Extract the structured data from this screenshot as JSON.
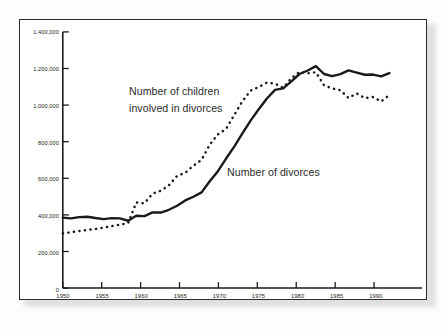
{
  "chart_data": {
    "type": "line",
    "title": "",
    "xlabel": "",
    "ylabel": "",
    "xlim": [
      1950,
      1994
    ],
    "ylim": [
      0,
      1400000
    ],
    "grid": false,
    "legend_position": "inline-annotations",
    "x_ticks": [
      1950,
      1955,
      1960,
      1965,
      1970,
      1975,
      1980,
      1985,
      1990
    ],
    "x_tick_labels": [
      "1950",
      "1955",
      "1960",
      "1965",
      "1970",
      "1975",
      "1980",
      "1985",
      "1990"
    ],
    "y_ticks": [
      0,
      200000,
      400000,
      600000,
      800000,
      1000000,
      1200000,
      1400000
    ],
    "y_tick_labels": [
      "0",
      "200,000",
      "400,000",
      "600,000",
      "800,000",
      "1,000,000",
      "1,200,000",
      "1,400,000"
    ],
    "annotations": [
      {
        "text_line1": "Number of children",
        "text_line2": "involved in divorces",
        "series": "children"
      },
      {
        "text_line1": "Number of divorces",
        "text_line2": "",
        "series": "divorces"
      }
    ],
    "x": [
      1950,
      1951,
      1952,
      1953,
      1954,
      1955,
      1956,
      1957,
      1958,
      1959,
      1960,
      1961,
      1962,
      1963,
      1964,
      1965,
      1966,
      1967,
      1968,
      1969,
      1970,
      1971,
      1972,
      1973,
      1974,
      1975,
      1976,
      1977,
      1978,
      1979,
      1980,
      1981,
      1982,
      1983,
      1984,
      1985,
      1986,
      1987,
      1988,
      1989,
      1990
    ],
    "series": [
      {
        "name": "Number of divorces",
        "style": "solid",
        "color": "#1a1a1a",
        "values": [
          385000,
          381000,
          388000,
          390000,
          383000,
          377000,
          382000,
          381000,
          368000,
          395000,
          393000,
          414000,
          413000,
          428000,
          450000,
          479000,
          499000,
          523000,
          584000,
          639000,
          708000,
          773000,
          845000,
          915000,
          977000,
          1036000,
          1083000,
          1091000,
          1130000,
          1170000,
          1189000,
          1213000,
          1170000,
          1158000,
          1169000,
          1190000,
          1178000,
          1166000,
          1167000,
          1157000,
          1175000
        ]
      },
      {
        "name": "Number of children involved in divorces",
        "style": "dotted",
        "color": "#1a1a1a",
        "values": [
          299000,
          305000,
          312000,
          318000,
          323000,
          330000,
          339000,
          347000,
          355000,
          468000,
          463000,
          516000,
          532000,
          562000,
          613000,
          630000,
          669000,
          701000,
          784000,
          840000,
          870000,
          946000,
          1021000,
          1079000,
          1099000,
          1123000,
          1117000,
          1095000,
          1147000,
          1181000,
          1174000,
          1180000,
          1108000,
          1091000,
          1081000,
          1039000,
          1064000,
          1038000,
          1044000,
          1020000,
          1055000
        ]
      }
    ]
  },
  "axis": {
    "y_label_0": "0",
    "y_label_1": "200,000",
    "y_label_2": "400,000",
    "y_label_3": "600,000",
    "y_label_4": "800,000",
    "y_label_5": "1,000,000",
    "y_label_6": "1,200,000",
    "y_label_7": "1,400,000",
    "x_label_0": "1950",
    "x_label_1": "1955",
    "x_label_2": "1960",
    "x_label_3": "1965",
    "x_label_4": "1970",
    "x_label_5": "1975",
    "x_label_6": "1980",
    "x_label_7": "1985",
    "x_label_8": "1990"
  },
  "annotations": {
    "children_line1": "Number of children",
    "children_line2": "involved in divorces",
    "divorces": "Number of divorces"
  }
}
